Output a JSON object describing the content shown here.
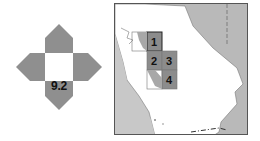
{
  "figure_number": "9.2",
  "locator_icon": {
    "name": "compass-locator-icon",
    "arrow_color": "#8f8f8f",
    "center_color": "#ffffff"
  },
  "map": {
    "region": "California",
    "land_color": "#ffffff",
    "ocean_color": "#c8c8c8",
    "neighbor_color": "#b9b9b9",
    "shaded_cell_color": "#8c8c8c",
    "grid_cells": [
      {
        "label": "1"
      },
      {
        "label": "2"
      },
      {
        "label": "3"
      },
      {
        "label": "4"
      }
    ]
  }
}
